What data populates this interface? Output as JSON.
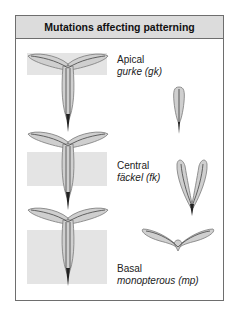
{
  "title": "Mutations affecting patterning",
  "rows": [
    {
      "region": "Apical",
      "gene": "gurke (gk)"
    },
    {
      "region": "Central",
      "gene": "fäckel (fk)"
    },
    {
      "region": "Basal",
      "gene": "monopterous (mp)"
    }
  ],
  "colors": {
    "shade": "#e4e4e4",
    "organ_fill": "#cfcfcf",
    "organ_outline": "#7a7a7a",
    "vascular": "#444444",
    "header_bg": "#dcdcdc"
  }
}
